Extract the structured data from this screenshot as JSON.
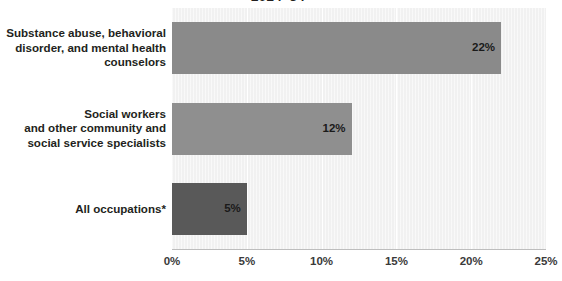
{
  "chart_data": {
    "type": "bar",
    "orientation": "horizontal",
    "title": "2024–34",
    "xlabel": "",
    "ylabel": "",
    "xlim": [
      0,
      25
    ],
    "grid": true,
    "legend": null,
    "tick_labels": [
      "0%",
      "5%",
      "10%",
      "15%",
      "20%",
      "25%"
    ],
    "tick_values": [
      0,
      5,
      10,
      15,
      20,
      25
    ],
    "categories": [
      "Substance abuse, behavioral disorder, and mental health counselors",
      "Social workers and other community and social service specialists",
      "All occupations*"
    ],
    "category_lines": [
      [
        "Substance abuse, behavioral",
        "disorder, and mental health",
        "counselors"
      ],
      [
        "Social workers",
        "and other community and",
        "social service specialists"
      ],
      [
        "All occupations*"
      ]
    ],
    "values": [
      22,
      12,
      5
    ],
    "data_labels": [
      "22%",
      "12%",
      "5%"
    ],
    "bar_colors": [
      "#8a8a8a",
      "#8f8f8f",
      "#595959"
    ],
    "plot_background": "#f1f1f1",
    "gridline_color": "#ffffff",
    "axis_color": "#bdbdbd"
  }
}
